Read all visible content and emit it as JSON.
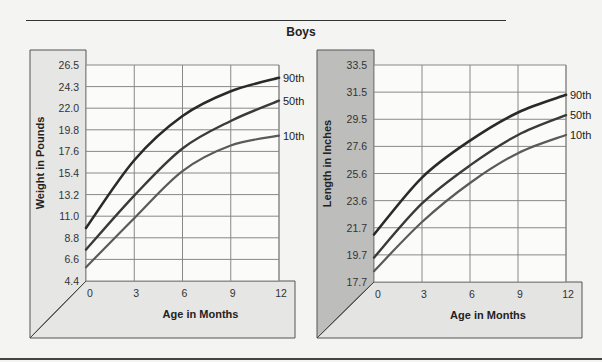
{
  "header": {
    "title": "Boys"
  },
  "colors": {
    "line_90": "#2a2a2a",
    "line_50": "#3a3a3a",
    "line_10": "#5a5a5a",
    "left_panel": "#e6e6e4",
    "right_panel": "#bdbdbb",
    "grid": "#888888"
  },
  "chart_data": [
    {
      "type": "line",
      "title": "Boys",
      "xlabel": "Age in Months",
      "ylabel": "Weight in Pounds",
      "x": [
        0,
        3,
        6,
        9,
        12
      ],
      "x_ticks": [
        "0",
        "3",
        "6",
        "9",
        "12"
      ],
      "y_ticks": [
        "4.4",
        "6.6",
        "8.8",
        "11.0",
        "13.2",
        "15.4",
        "17.6",
        "19.8",
        "22.0",
        "24.3",
        "26.5"
      ],
      "ylim": [
        4.4,
        26.5
      ],
      "xlim": [
        0,
        12
      ],
      "grid": true,
      "legend_position": "right-end labels",
      "series": [
        {
          "name": "90th",
          "values": [
            9.8,
            16.7,
            21.2,
            23.8,
            25.2
          ]
        },
        {
          "name": "50th",
          "values": [
            7.6,
            13.1,
            17.9,
            20.7,
            22.8
          ]
        },
        {
          "name": "10th",
          "values": [
            5.8,
            10.8,
            15.6,
            18.2,
            19.2
          ]
        }
      ]
    },
    {
      "type": "line",
      "title": "Boys",
      "xlabel": "Age in Months",
      "ylabel": "Length in Inches",
      "x": [
        0,
        3,
        6,
        9,
        12
      ],
      "x_ticks": [
        "0",
        "3",
        "6",
        "9",
        "12"
      ],
      "y_ticks": [
        "17.7",
        "19.7",
        "21.7",
        "23.6",
        "25.6",
        "27.6",
        "29.5",
        "31.5",
        "33.5"
      ],
      "ylim": [
        17.7,
        33.5
      ],
      "xlim": [
        0,
        12
      ],
      "grid": true,
      "legend_position": "right-end labels",
      "series": [
        {
          "name": "90th",
          "values": [
            21.2,
            25.3,
            28.0,
            30.0,
            31.3
          ]
        },
        {
          "name": "50th",
          "values": [
            19.5,
            23.4,
            26.2,
            28.4,
            29.8
          ]
        },
        {
          "name": "10th",
          "values": [
            18.5,
            22.1,
            24.9,
            27.1,
            28.4
          ]
        }
      ]
    }
  ]
}
